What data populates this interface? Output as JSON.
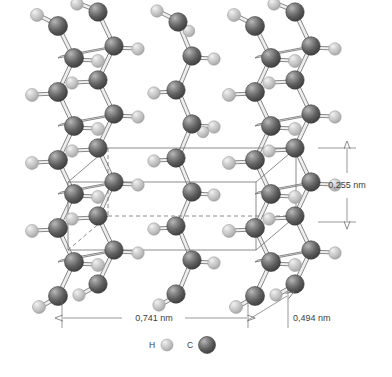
{
  "figure": {
    "background_color": "#ffffff"
  },
  "dimensions": [
    {
      "id": "height",
      "label": "0,255 nm",
      "orientation": "vertical",
      "value": 0.255,
      "unit": "nm"
    },
    {
      "id": "width",
      "label": "0,741 nm",
      "orientation": "horizontal",
      "value": 0.741,
      "unit": "nm"
    },
    {
      "id": "depth",
      "label": "0,494 nm",
      "orientation": "diagonal",
      "value": 0.494,
      "unit": "nm"
    }
  ],
  "legend": {
    "items": [
      {
        "symbol": "H",
        "name": "hydrogen",
        "color": "#c2c2c2"
      },
      {
        "symbol": "C",
        "name": "carbon",
        "color": "#565656"
      }
    ]
  },
  "colors": {
    "carbon": "#565656",
    "carbon_highlight": "#9a9a9a",
    "carbon_edge": "#3a3a3a",
    "hydrogen": "#c2c2c2",
    "hydrogen_highlight": "#ededed",
    "hydrogen_edge": "#9d9d9d",
    "bond": "#e8e8e8",
    "bond_edge": "#585858",
    "cell_line": "#6e6e6e",
    "dim_line": "#6e6e6e",
    "text": "#3d3d3d"
  },
  "structure": {
    "description": "Three polyethylene zigzag chains drawn in perspective with a transparent orthorhombic unit cell box",
    "chain_count": 3,
    "atoms_shown": [
      "C",
      "H"
    ]
  }
}
